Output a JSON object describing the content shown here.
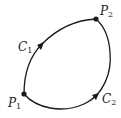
{
  "diagram": {
    "type": "closed-curve-paths",
    "colors": {
      "stroke": "#1a1a1a",
      "text": "#222222",
      "background": "#ffffff"
    },
    "points": [
      {
        "id": "P1",
        "label": "P",
        "subscript": "1",
        "x": 24,
        "y": 94
      },
      {
        "id": "P2",
        "label": "P",
        "subscript": "2",
        "x": 96,
        "y": 19
      }
    ],
    "curves": [
      {
        "id": "C1",
        "label": "C",
        "subscript": "1",
        "from": "P1",
        "to": "P2",
        "side": "upper-left"
      },
      {
        "id": "C2",
        "label": "C",
        "subscript": "2",
        "from": "P1",
        "to": "P2",
        "side": "lower-right"
      }
    ]
  }
}
